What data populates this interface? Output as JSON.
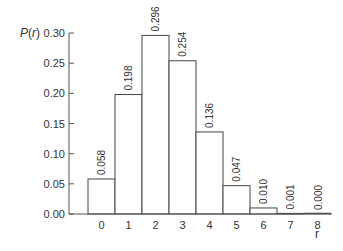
{
  "chart_data": {
    "type": "bar",
    "title": "",
    "xlabel": "r",
    "ylabel": "P(r)",
    "ylabel_func": "P",
    "ylabel_var": "r",
    "categories": [
      "0",
      "1",
      "2",
      "3",
      "4",
      "5",
      "6",
      "7",
      "8"
    ],
    "values": [
      0.058,
      0.198,
      0.296,
      0.254,
      0.136,
      0.047,
      0.01,
      0.001,
      0.0
    ],
    "value_labels": [
      "0.058",
      "0.198",
      "0.296",
      "0.254",
      "0.136",
      "0.047",
      "0.010",
      "0.001",
      "0.000"
    ],
    "yticks": [
      "0.00",
      "0.05",
      "0.10",
      "0.15",
      "0.20",
      "0.25",
      "0.30"
    ],
    "ylim": [
      0,
      0.3
    ],
    "grid": false,
    "legend": null
  },
  "colors": {
    "axis": "#555555",
    "bar_fill": "#ffffff",
    "bar_stroke": "#444444",
    "text": "#333333"
  }
}
